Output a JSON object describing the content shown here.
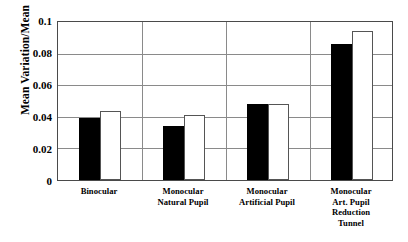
{
  "figure": {
    "header_sliver_text": "",
    "background_color": "#ffffff"
  },
  "axes": {
    "y_title": "Mean Variation/Mean",
    "y_ticks": [
      "0.1",
      "0.08",
      "0.06",
      "0.04",
      "0.02",
      "0"
    ],
    "x_title": ""
  },
  "chart_data": {
    "type": "bar",
    "title": "",
    "subtitle": "",
    "xlabel": "",
    "ylabel": "Mean Variation/Mean",
    "ylim": [
      0,
      0.1
    ],
    "ytick_values": [
      0,
      0.02,
      0.04,
      0.06,
      0.08,
      0.1
    ],
    "ytick_labels": [
      "0",
      "0.02",
      "0.04",
      "0.06",
      "0.08",
      "0.1"
    ],
    "grid": "horizontal",
    "legend": "none",
    "legend_position": "none",
    "annotations": [],
    "categories": [
      "Binocular",
      "Monocular Natural Pupil",
      "Monocular Artificial Pupil",
      "Monocular Art. Pupil Reduction Tunnel"
    ],
    "category_label_lines": [
      [
        "Binocular"
      ],
      [
        "Monocular",
        "Natural Pupil"
      ],
      [
        "Monocular",
        "Artificial Pupil"
      ],
      [
        "Monocular",
        "Art. Pupil",
        "Reduction",
        "Tunnel"
      ]
    ],
    "series": [
      {
        "name": "series-1",
        "fill": "black",
        "color": "#000000",
        "values": [
          0.0395,
          0.034,
          0.048,
          0.086
        ]
      },
      {
        "name": "series-2",
        "fill": "white",
        "color": "#ffffff",
        "edge_color": "#555555",
        "values": [
          0.0435,
          0.041,
          0.0478,
          0.094
        ]
      }
    ]
  },
  "colors": {
    "bar_dark": "#000000",
    "bar_light": "#ffffff",
    "bar_light_edge": "#555555",
    "gridline": "#8a8a8a",
    "frame": "#4a4a4a",
    "text": "#000000"
  }
}
